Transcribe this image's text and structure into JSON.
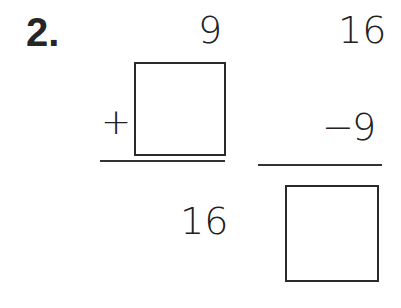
{
  "problem": {
    "number_label": "2.",
    "addition": {
      "addend_top": "9",
      "operator": "+",
      "addend_bottom": "",
      "sum": "16"
    },
    "subtraction": {
      "minuend": "16",
      "operator": "−",
      "subtrahend": "9",
      "difference": ""
    }
  }
}
